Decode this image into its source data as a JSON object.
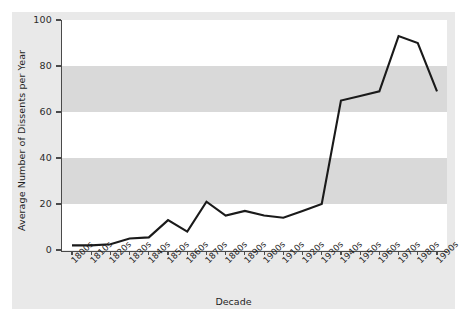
{
  "chart_data": {
    "type": "line",
    "title": "",
    "xlabel": "Decade",
    "ylabel": "Average Number of Dissents per Year",
    "categories": [
      "1800s",
      "1810s",
      "1820s",
      "1830s",
      "1840s",
      "1850s",
      "1860s",
      "1870s",
      "1880s",
      "1890s",
      "1900s",
      "1910s",
      "1920s",
      "1930s",
      "1940s",
      "1950s",
      "1960s",
      "1970s",
      "1980s",
      "1990s"
    ],
    "values": [
      2,
      2,
      2.5,
      5,
      5.5,
      13,
      8,
      21,
      15,
      17,
      15,
      14,
      17,
      20,
      65,
      67,
      69,
      93,
      90,
      69
    ],
    "series": [
      {
        "name": "Average Number of Dissents per Year",
        "values": [
          2,
          2,
          2.5,
          5,
          5.5,
          13,
          8,
          21,
          15,
          17,
          15,
          14,
          17,
          20,
          65,
          67,
          69,
          93,
          90,
          69
        ]
      }
    ],
    "ylim": [
      0,
      100
    ],
    "yticks": [
      0,
      20,
      40,
      60,
      80,
      100
    ],
    "ytick_labels": [
      "0",
      "20",
      "40",
      "60",
      "80",
      "100"
    ],
    "grid": false,
    "banded_background": true,
    "legend": "none",
    "line_color": "#1a1a1a",
    "band_color": "#d9d9d9",
    "plot_background": "#ffffff",
    "figure_background": "#e9e9e9"
  }
}
